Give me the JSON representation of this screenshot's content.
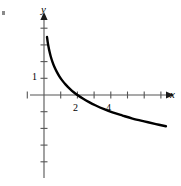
{
  "figure": {
    "corner_mark": "",
    "axis_labels": {
      "x": "x",
      "y": "y"
    },
    "tick_labels": {
      "y_one": "1",
      "x_two": "2",
      "x_four": "4"
    },
    "colors": {
      "axis": "#555555",
      "curve": "#000000",
      "tick": "#555555",
      "background": "#ffffff"
    }
  },
  "chart_data": {
    "type": "line",
    "title": "",
    "subtitle": "",
    "xlabel": "x",
    "ylabel": "y",
    "grid": false,
    "legend": null,
    "xlim": [
      -0.85,
      8.2
    ],
    "ylim": [
      -4.8,
      4.8
    ],
    "x_ticks": [
      1,
      2,
      3,
      4,
      5,
      6,
      7
    ],
    "y_ticks": [
      -4,
      -3,
      -2,
      -1,
      1,
      2,
      3,
      4
    ],
    "x_tick_labels": {
      "2": "2",
      "4": "4"
    },
    "y_tick_labels": {
      "1": "1"
    },
    "annotations": [
      {
        "text": "x-intercept at x = 2",
        "x": 2,
        "y": 0
      },
      {
        "text": "vertical asymptote at x = 0",
        "x": 0,
        "y": null
      }
    ],
    "series": [
      {
        "name": "y = 1 - log2(x)",
        "x": [
          0.18,
          0.22,
          0.27,
          0.33,
          0.4,
          0.5,
          0.62,
          0.76,
          0.92,
          1.1,
          1.3,
          1.55,
          1.8,
          2.0,
          2.3,
          2.7,
          3.1,
          3.6,
          4.1,
          4.7,
          5.3,
          6.0,
          6.7,
          7.3
        ],
        "y": [
          3.47,
          3.18,
          2.89,
          2.6,
          2.32,
          2.0,
          1.69,
          1.4,
          1.12,
          0.86,
          0.62,
          0.37,
          0.15,
          0.0,
          -0.2,
          -0.43,
          -0.63,
          -0.85,
          -1.04,
          -1.23,
          -1.41,
          -1.58,
          -1.74,
          -1.87
        ]
      }
    ]
  }
}
